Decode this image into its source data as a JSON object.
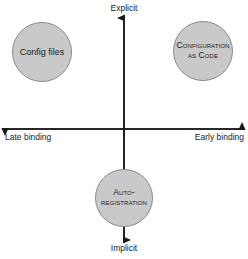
{
  "diagram": {
    "axes": {
      "vertical": {
        "top_label": "Explicit",
        "bottom_label": "Implicit"
      },
      "horizontal": {
        "left_label": "Late binding",
        "right_label": "Early binding"
      }
    },
    "bubbles": [
      {
        "id": "config-files",
        "label": "Config files",
        "quadrant": "upper-left",
        "style": "normal-case"
      },
      {
        "id": "configuration-as-code",
        "label_line1": "Configuration",
        "label_line2": "as Code",
        "quadrant": "upper-right",
        "style": "small-caps"
      },
      {
        "id": "auto-registration",
        "label_line1": "Auto-",
        "label_line2": "registration",
        "quadrant": "bottom-center",
        "style": "small-caps"
      }
    ],
    "colors": {
      "bubble_fill": "#c9c9c9",
      "bubble_stroke": "#8a8a8a",
      "axis": "#1a1a1a",
      "background": "#ffffff",
      "text": "#1a1a1a"
    }
  }
}
